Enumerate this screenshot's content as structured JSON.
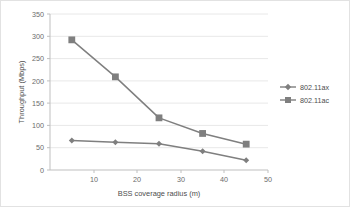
{
  "chart_data": {
    "type": "line",
    "title": "",
    "xlabel": "BSS coverage radius (m)",
    "ylabel": "Throughput (Mbps)",
    "x": [
      10,
      20,
      30,
      40,
      50
    ],
    "xticklabels": [
      "10",
      "20",
      "30",
      "40",
      "50"
    ],
    "yticklabels": [
      "0",
      "50",
      "100",
      "150",
      "200",
      "250",
      "300",
      "350"
    ],
    "yticks": [
      0,
      50,
      100,
      150,
      200,
      250,
      300,
      350
    ],
    "xlim": [
      5,
      55
    ],
    "ylim": [
      0,
      350
    ],
    "grid": "horizontal",
    "legend_position": "right",
    "series": [
      {
        "name": "802.11ax",
        "marker": "diamond",
        "color": "#7f7f7f",
        "values": [
          66,
          62,
          59,
          42,
          22
        ]
      },
      {
        "name": "802.11ac",
        "marker": "square",
        "color": "#7f7f7f",
        "values": [
          292,
          209,
          117,
          82,
          58
        ]
      }
    ]
  },
  "axes": {
    "y_title": "Throughput (Mbps)",
    "x_title": "BSS coverage radius (m)",
    "y_ticks": [
      "350",
      "300",
      "250",
      "200",
      "150",
      "100",
      "50",
      "0"
    ],
    "x_ticks": [
      "10",
      "20",
      "30",
      "40",
      "50"
    ]
  },
  "legend": {
    "items": [
      {
        "label": "802.11ax",
        "marker": "diamond-marker-icon"
      },
      {
        "label": "802.11ac",
        "marker": "square-marker-icon"
      }
    ]
  },
  "colors": {
    "series_line": "#7f7f7f",
    "gridline": "#e8e8e8",
    "axis": "#bfbfbf",
    "tick_label": "#6b6b6b",
    "frame": "#e2e2e2"
  }
}
